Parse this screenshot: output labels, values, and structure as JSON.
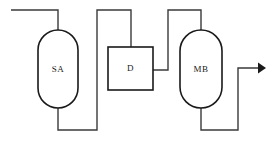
{
  "diagram": {
    "background_color": "#ffffff",
    "line_color": "#3a3a3a",
    "outline_color": "#1a1a1a",
    "units": [
      {
        "id": "sa",
        "label": "SA",
        "shape": "stadium-vessel",
        "x": 38,
        "y": 30,
        "width": 40,
        "height": 78
      },
      {
        "id": "d",
        "label": "D",
        "shape": "rectangle",
        "x": 108,
        "y": 47,
        "width": 45,
        "height": 43
      },
      {
        "id": "mb",
        "label": "MB",
        "shape": "stadium-vessel",
        "x": 180,
        "y": 30,
        "width": 42,
        "height": 78
      }
    ],
    "streams": [
      {
        "id": "feed-inlet",
        "name": "feed-to-sa",
        "from": "feed",
        "to": "sa",
        "path": "M 11 10 L 58 10 L 58 30"
      },
      {
        "id": "sa-bottom-to-riser",
        "name": "sa-bottom-to-d",
        "from": "sa",
        "to": "d",
        "path": "M 58 108 L 58 130 L 97 130 L 97 10 L 131 10 L 131 47"
      },
      {
        "id": "d-to-mb",
        "name": "d-outlet-to-mb",
        "from": "d",
        "to": "mb",
        "path": "M 153 70 L 168 70 L 168 10 L 201 10 L 201 30"
      },
      {
        "id": "mb-product-outlet",
        "name": "mb-bottom-to-product",
        "from": "mb",
        "to": "product",
        "path": "M 201 108 L 201 130 L 238 130 L 238 68 L 259 68"
      }
    ],
    "arrows": [
      {
        "id": "product-arrow",
        "name": "product-outlet-arrow",
        "direction": "right",
        "tip_x": 266,
        "tip_y": 68
      }
    ]
  }
}
